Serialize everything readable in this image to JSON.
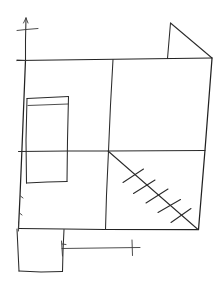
{
  "document": {
    "title": "Hand-drawn floor plan sketch",
    "medium": "pen on white paper",
    "width_px": 222,
    "height_px": 283,
    "background_color": "#ffffff",
    "ink_color": "#2b2b2b",
    "description": "Freehand architectural floor plan: outer wall rectangle divided by one vertical and one horizontal partition, a narrow room at left, a hatched diagonal stair run in the lower right quadrant, a triangular canopy above the top wall, a room extension below the bottom wall, and dimension lines with tick marks."
  },
  "strokes": {
    "outer_wall": {
      "name": "outer-wall-rectangle",
      "label": "Outer wall outline",
      "path": "M25.5,60.5 L212,58 L198.5,229 L18.5,228.5 Z"
    },
    "top_wall": {
      "name": "top-wall",
      "label": "Top exterior wall",
      "path": "M17,60.5 L212,58"
    },
    "left_wall": {
      "name": "left-wall",
      "label": "Left exterior wall",
      "path": "M25.5,60 L22,148 L20,196 L18.5,228.5"
    },
    "right_wall": {
      "name": "right-wall",
      "label": "Right exterior wall",
      "path": "M212,58.5 L205,150 L198.5,229.5"
    },
    "bottom_wall": {
      "name": "bottom-wall",
      "label": "Bottom exterior wall",
      "path": "M18.5,228.5 L64,229 L105,229.5 L198.5,229.5"
    },
    "vertical_partition": {
      "name": "vertical-partition-wall",
      "label": "Vertical interior partition",
      "path": "M113,59.5 L110.5,105 L108.5,151 L106.5,195 L105.5,229.5"
    },
    "horizontal_partition": {
      "name": "horizontal-partition-wall",
      "label": "Horizontal interior partition",
      "path": "M18.5,151.5 L68,151 L108.5,151 L205,150.5"
    },
    "inner_room_outline": {
      "name": "inner-room-rectangle",
      "label": "Small left room",
      "path": "M27,98 L68.5,96 L67.5,140 L67,181.5 L26.5,183 L25.5,140 Z"
    },
    "inner_room_top_line": {
      "name": "inner-room-top-edge",
      "label": "Left room upper edge",
      "path": "M27,98.5 L68.5,96.5"
    },
    "inner_room_second_line": {
      "name": "inner-room-inner-ledge",
      "label": "Left room inner ledge line",
      "path": "M28,105.5 L68,104"
    },
    "inner_room_right_line": {
      "name": "inner-room-right-edge",
      "label": "Left room right edge",
      "path": "M68.5,96.5 L67.5,140 L67,181.5"
    },
    "inner_room_left_line": {
      "name": "inner-room-left-edge",
      "label": "Left room left edge",
      "path": "M27,98.5 L26,140 L26.5,183"
    },
    "inner_room_bottom_line": {
      "name": "inner-room-bottom-edge",
      "label": "Left room bottom edge",
      "path": "M26.5,183 L47,182 L67,181.5"
    },
    "roof_triangle_vertical": {
      "name": "canopy-vertical-edge",
      "label": "Canopy vertical edge",
      "path": "M170.5,23 L167.5,58.5"
    },
    "roof_triangle_hypotenuse": {
      "name": "canopy-sloped-edge",
      "label": "Canopy sloped edge",
      "path": "M170.5,23 L212,58"
    },
    "stair_diagonal": {
      "name": "stair-run-diagonal",
      "label": "Stair run centre line",
      "path": "M108,151 L198,229.5"
    },
    "stair_treads": [
      {
        "name": "stair-tread-1",
        "label": "Stair tread 1",
        "path": "M123,182.5 L143.5,169"
      },
      {
        "name": "stair-tread-2",
        "label": "Stair tread 2",
        "path": "M133.5,193.5 L155,180"
      },
      {
        "name": "stair-tread-3",
        "label": "Stair tread 3",
        "path": "M146,203 L168,189"
      },
      {
        "name": "stair-tread-4",
        "label": "Stair tread 4",
        "path": "M158,212.5 L180.5,199.5"
      },
      {
        "name": "stair-tread-5",
        "label": "Stair tread 5",
        "path": "M171,222.5 L191,208.5"
      }
    ],
    "bottom_extension": {
      "name": "bottom-extension-room",
      "label": "Room extension below bottom wall",
      "path": "M17,229 L64,229.5 L63,251 L62.5,271.5 L19,271 Z"
    },
    "bottom_extension_left": {
      "name": "bottom-extension-left-edge",
      "label": "Extension left edge",
      "path": "M17,229 L18,250 L19,271"
    },
    "bottom_extension_right": {
      "name": "bottom-extension-right-edge",
      "label": "Extension right edge",
      "path": "M64,229.5 L63,251 L62.5,271.5"
    },
    "bottom_extension_bottom": {
      "name": "bottom-extension-bottom-edge",
      "label": "Extension bottom edge",
      "path": "M19,271 L41,272 L62.5,271.5"
    },
    "dimension_line": {
      "name": "bottom-dimension-line",
      "label": "Bottom dimension line",
      "path": "M62,248.5 L100,248 L140,247.5"
    },
    "dimension_tick_left": {
      "name": "dimension-tick-left",
      "label": "Left dimension tick",
      "path": "M61.5,241 L62.5,256"
    },
    "dimension_tick_right": {
      "name": "dimension-tick-right",
      "label": "Right dimension tick",
      "path": "M132,240 L132.5,255.5"
    },
    "top_axis_line": {
      "name": "top-axis-line",
      "label": "Top vertical reference line",
      "path": "M26,18 L25.5,40 L25.5,61"
    },
    "top_axis_cross": {
      "name": "top-axis-crossbar",
      "label": "Top reference crossbar",
      "path": "M17,30.5 L26,29.5 L38,28.5"
    },
    "top_axis_arrow": {
      "name": "top-axis-arrowhead",
      "label": "Top reference arrow tip",
      "path": "M26,18 L23.5,23 M26,18 L28,23"
    },
    "left_wall_nick_upper": {
      "name": "left-wall-opening-upper",
      "label": "Left wall opening mark (upper)",
      "path": "M20.5,196 L23,198"
    },
    "left_wall_nick_lower": {
      "name": "left-wall-opening-lower",
      "label": "Left wall opening mark (lower)",
      "path": "M19.5,213 L22,215"
    },
    "corner_nick_top_left": {
      "name": "top-left-corner-nick",
      "label": "Top-left corner overrun",
      "path": "M17,60 L25.5,60.5"
    },
    "corner_nick_bottom_left": {
      "name": "bottom-left-corner-nick",
      "label": "Bottom-left corner overrun",
      "path": "M18.5,222 L18.5,231"
    },
    "extension_tick": {
      "name": "extension-right-tick",
      "label": "Extension right-edge tick",
      "path": "M62,244 L66,244.5"
    }
  }
}
